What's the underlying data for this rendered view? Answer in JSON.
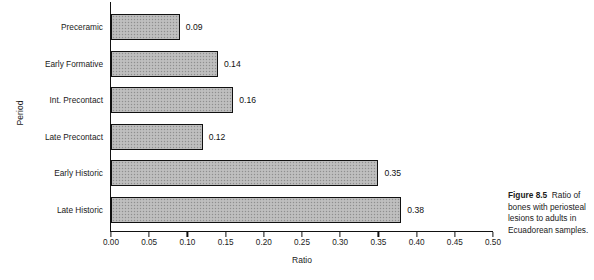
{
  "chart_data": {
    "type": "bar",
    "orientation": "horizontal",
    "title": "",
    "xlabel": "Ratio",
    "ylabel": "Period",
    "xlim": [
      0.0,
      0.5
    ],
    "grid": false,
    "legend": null,
    "xticks": [
      "0.00",
      "0.05",
      "0.10",
      "0.15",
      "0.20",
      "0.25",
      "0.30",
      "0.35",
      "0.40",
      "0.45",
      "0.50"
    ],
    "xtick_values": [
      0.0,
      0.05,
      0.1,
      0.15,
      0.2,
      0.25,
      0.3,
      0.35,
      0.4,
      0.45,
      0.5
    ],
    "categories": [
      "Preceramic",
      "Early Formative",
      "Int. Precontact",
      "Late Precontact",
      "Early Historic",
      "Late Historic"
    ],
    "values": [
      0.09,
      0.14,
      0.16,
      0.12,
      0.35,
      0.38
    ],
    "value_labels": [
      "0.09",
      "0.14",
      "0.16",
      "0.12",
      "0.35",
      "0.38"
    ],
    "bar_facecolor": "#b9b9b9",
    "bar_edgecolor": "#111111"
  },
  "caption": {
    "figure_number": "Figure 8.5",
    "text": "Ratio of bones with periosteal lesions to adults in Ecuadorean samples."
  }
}
